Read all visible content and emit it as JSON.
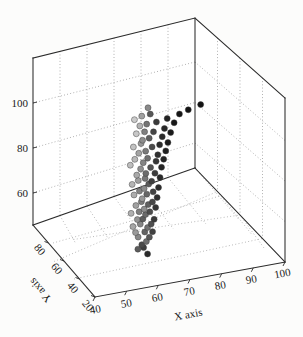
{
  "figure": {
    "background_color": "#fcfcfb",
    "width": 303,
    "height": 337
  },
  "chart_data": {
    "type": "scatter",
    "projection": "3d",
    "title": "",
    "xlabel": "X axis",
    "ylabel": "Y axis",
    "zlabel": "",
    "grid": true,
    "legend": null,
    "xlim": [
      35,
      105
    ],
    "ylim": [
      15,
      90
    ],
    "zlim": [
      50,
      112
    ],
    "xticks": [
      40,
      50,
      60,
      70,
      80,
      90,
      100
    ],
    "yticks": [
      80,
      60,
      40,
      20
    ],
    "zticks": [
      60,
      80,
      100
    ],
    "xticklabels": [
      "40",
      "50",
      "60",
      "70",
      "80",
      "90",
      "100"
    ],
    "yticklabels": [
      "80",
      "60",
      "40",
      "20"
    ],
    "zticklabels": [
      "60",
      "80",
      "100"
    ],
    "marker": "circle",
    "marker_colormap": "grayscale",
    "marker_size_px": 6,
    "point_count": 205,
    "points": [
      {
        "x": 62.0,
        "y": 47.0,
        "z": 53.0,
        "shade": "#4a4a4a"
      },
      {
        "x": 63.2,
        "y": 45.5,
        "z": 54.5,
        "shade": "#6e6e6e"
      },
      {
        "x": 61.0,
        "y": 48.2,
        "z": 55.6,
        "shade": "#898989"
      },
      {
        "x": 64.1,
        "y": 44.8,
        "z": 56.2,
        "shade": "#575757"
      },
      {
        "x": 60.3,
        "y": 49.0,
        "z": 57.1,
        "shade": "#9b9b9b"
      },
      {
        "x": 62.8,
        "y": 46.1,
        "z": 57.9,
        "shade": "#636363"
      },
      {
        "x": 65.0,
        "y": 43.9,
        "z": 58.4,
        "shade": "#414141"
      },
      {
        "x": 59.7,
        "y": 50.2,
        "z": 59.0,
        "shade": "#a6a6a6"
      },
      {
        "x": 63.5,
        "y": 45.0,
        "z": 59.8,
        "shade": "#727272"
      },
      {
        "x": 61.6,
        "y": 47.6,
        "z": 60.5,
        "shade": "#868686"
      },
      {
        "x": 64.6,
        "y": 44.2,
        "z": 61.2,
        "shade": "#4f4f4f"
      },
      {
        "x": 60.9,
        "y": 48.8,
        "z": 61.9,
        "shade": "#939393"
      },
      {
        "x": 62.3,
        "y": 46.7,
        "z": 62.6,
        "shade": "#5d5d5d"
      },
      {
        "x": 65.4,
        "y": 43.3,
        "z": 63.1,
        "shade": "#383838"
      },
      {
        "x": 59.2,
        "y": 50.8,
        "z": 63.8,
        "shade": "#b0b0b0"
      },
      {
        "x": 63.0,
        "y": 45.9,
        "z": 64.4,
        "shade": "#6a6a6a"
      },
      {
        "x": 61.3,
        "y": 48.0,
        "z": 65.0,
        "shade": "#7e7e7e"
      },
      {
        "x": 64.2,
        "y": 44.5,
        "z": 65.7,
        "shade": "#4c4c4c"
      },
      {
        "x": 62.7,
        "y": 46.4,
        "z": 66.3,
        "shade": "#8f8f8f"
      },
      {
        "x": 60.5,
        "y": 49.3,
        "z": 67.0,
        "shade": "#a1a1a1"
      },
      {
        "x": 65.8,
        "y": 42.8,
        "z": 67.6,
        "shade": "#343434"
      },
      {
        "x": 63.8,
        "y": 45.2,
        "z": 68.2,
        "shade": "#606060"
      },
      {
        "x": 61.9,
        "y": 47.2,
        "z": 68.9,
        "shade": "#7b7b7b"
      },
      {
        "x": 64.9,
        "y": 43.7,
        "z": 69.5,
        "shade": "#474747"
      },
      {
        "x": 62.1,
        "y": 46.9,
        "z": 70.1,
        "shade": "#979797"
      },
      {
        "x": 60.0,
        "y": 49.9,
        "z": 70.8,
        "shade": "#acacac"
      },
      {
        "x": 66.2,
        "y": 42.3,
        "z": 71.4,
        "shade": "#2f2f2f"
      },
      {
        "x": 63.4,
        "y": 45.6,
        "z": 72.0,
        "shade": "#666666"
      },
      {
        "x": 61.4,
        "y": 47.9,
        "z": 72.7,
        "shade": "#828282"
      },
      {
        "x": 65.1,
        "y": 43.5,
        "z": 73.3,
        "shade": "#434343"
      },
      {
        "x": 62.6,
        "y": 46.2,
        "z": 74.0,
        "shade": "#8b8b8b"
      },
      {
        "x": 59.5,
        "y": 50.5,
        "z": 74.6,
        "shade": "#b4b4b4"
      },
      {
        "x": 66.6,
        "y": 41.9,
        "z": 75.2,
        "shade": "#2b2b2b"
      },
      {
        "x": 63.9,
        "y": 44.9,
        "z": 75.9,
        "shade": "#5a5a5a"
      },
      {
        "x": 61.1,
        "y": 48.4,
        "z": 76.5,
        "shade": "#9e9e9e"
      },
      {
        "x": 64.7,
        "y": 44.0,
        "z": 77.1,
        "shade": "#3f3f3f"
      },
      {
        "x": 62.9,
        "y": 46.0,
        "z": 77.8,
        "shade": "#777777"
      },
      {
        "x": 60.7,
        "y": 48.9,
        "z": 78.4,
        "shade": "#a9a9a9"
      },
      {
        "x": 67.0,
        "y": 41.4,
        "z": 79.0,
        "shade": "#282828"
      },
      {
        "x": 63.1,
        "y": 45.8,
        "z": 79.7,
        "shade": "#6c6c6c"
      },
      {
        "x": 65.6,
        "y": 43.0,
        "z": 80.3,
        "shade": "#3c3c3c"
      },
      {
        "x": 61.7,
        "y": 47.5,
        "z": 81.0,
        "shade": "#909090"
      },
      {
        "x": 59.0,
        "y": 51.1,
        "z": 81.6,
        "shade": "#bdbdbd"
      },
      {
        "x": 64.4,
        "y": 44.3,
        "z": 82.2,
        "shade": "#525252"
      },
      {
        "x": 67.4,
        "y": 40.9,
        "z": 82.9,
        "shade": "#252525"
      },
      {
        "x": 62.4,
        "y": 46.6,
        "z": 83.5,
        "shade": "#848484"
      },
      {
        "x": 60.2,
        "y": 49.6,
        "z": 84.1,
        "shade": "#b8b8b8"
      },
      {
        "x": 65.9,
        "y": 42.6,
        "z": 84.8,
        "shade": "#363636"
      },
      {
        "x": 63.6,
        "y": 45.3,
        "z": 85.4,
        "shade": "#6f6f6f"
      },
      {
        "x": 68.0,
        "y": 40.3,
        "z": 86.0,
        "shade": "#222222"
      },
      {
        "x": 61.2,
        "y": 48.1,
        "z": 86.7,
        "shade": "#a4a4a4"
      },
      {
        "x": 66.4,
        "y": 42.1,
        "z": 87.3,
        "shade": "#303030"
      },
      {
        "x": 63.0,
        "y": 45.7,
        "z": 88.0,
        "shade": "#7a7a7a"
      },
      {
        "x": 59.8,
        "y": 50.0,
        "z": 88.6,
        "shade": "#c2c2c2"
      },
      {
        "x": 68.6,
        "y": 39.7,
        "z": 89.2,
        "shade": "#1f1f1f"
      },
      {
        "x": 64.8,
        "y": 43.8,
        "z": 89.9,
        "shade": "#4b4b4b"
      },
      {
        "x": 61.8,
        "y": 47.3,
        "z": 90.5,
        "shade": "#999999"
      },
      {
        "x": 66.9,
        "y": 41.6,
        "z": 91.1,
        "shade": "#2d2d2d"
      },
      {
        "x": 62.2,
        "y": 46.8,
        "z": 91.8,
        "shade": "#8d8d8d"
      },
      {
        "x": 69.2,
        "y": 39.1,
        "z": 92.4,
        "shade": "#1c1c1c"
      },
      {
        "x": 64.0,
        "y": 44.7,
        "z": 93.0,
        "shade": "#5e5e5e"
      },
      {
        "x": 60.6,
        "y": 49.1,
        "z": 93.7,
        "shade": "#c7c7c7"
      },
      {
        "x": 67.6,
        "y": 40.7,
        "z": 94.3,
        "shade": "#292929"
      },
      {
        "x": 62.8,
        "y": 46.3,
        "z": 95.0,
        "shade": "#808080"
      },
      {
        "x": 65.2,
        "y": 43.4,
        "z": 95.6,
        "shade": "#454545"
      },
      {
        "x": 70.0,
        "y": 38.4,
        "z": 96.2,
        "shade": "#1a1a1a"
      },
      {
        "x": 61.5,
        "y": 47.8,
        "z": 96.9,
        "shade": "#b2b2b2"
      },
      {
        "x": 68.2,
        "y": 40.0,
        "z": 97.5,
        "shade": "#262626"
      },
      {
        "x": 63.3,
        "y": 45.4,
        "z": 98.1,
        "shade": "#757575"
      },
      {
        "x": 60.1,
        "y": 49.7,
        "z": 98.8,
        "shade": "#cacaca"
      },
      {
        "x": 66.0,
        "y": 42.5,
        "z": 99.4,
        "shade": "#3a3a3a"
      },
      {
        "x": 71.0,
        "y": 37.5,
        "z": 100.0,
        "shade": "#181818"
      },
      {
        "x": 62.0,
        "y": 47.1,
        "z": 100.7,
        "shade": "#a0a0a0"
      },
      {
        "x": 69.0,
        "y": 39.3,
        "z": 101.3,
        "shade": "#232323"
      },
      {
        "x": 64.3,
        "y": 44.4,
        "z": 102.0,
        "shade": "#585858"
      },
      {
        "x": 72.5,
        "y": 36.0,
        "z": 103.5,
        "shade": "#161616"
      },
      {
        "x": 63.7,
        "y": 45.1,
        "z": 104.2,
        "shade": "#8a8a8a"
      },
      {
        "x": 75.0,
        "y": 33.5,
        "z": 105.5,
        "shade": "#141414"
      },
      {
        "x": 78.5,
        "y": 30.0,
        "z": 108.0,
        "shade": "#121212"
      },
      {
        "x": 62.5,
        "y": 46.5,
        "z": 52.0,
        "shade": "#3d3d3d"
      },
      {
        "x": 61.0,
        "y": 48.5,
        "z": 51.0,
        "shade": "#5c5c5c"
      },
      {
        "x": 63.5,
        "y": 45.0,
        "z": 50.0,
        "shade": "#2a2a2a"
      }
    ]
  },
  "axes": {
    "x": {
      "label": "X axis",
      "ticks": [
        "40",
        "50",
        "60",
        "70",
        "80",
        "90",
        "100"
      ]
    },
    "y": {
      "label": "Y axis",
      "ticks": [
        "80",
        "60",
        "40",
        "20"
      ]
    },
    "z": {
      "label": "",
      "ticks": [
        "60",
        "80",
        "100"
      ]
    }
  }
}
